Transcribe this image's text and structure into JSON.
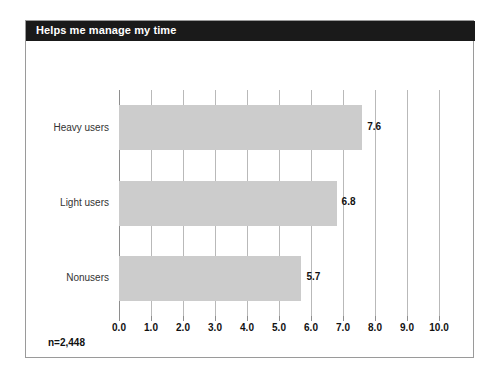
{
  "card": {
    "title": "Helps me manage my time",
    "footnote": "n=2,448"
  },
  "colors": {
    "title_bar": "#1a1a1a",
    "title_text": "#ffffff",
    "bar_fill": "#cccccc",
    "gridline": "#b9b9b9",
    "axis": "#8e8e8e",
    "frame": "#9a9a9a",
    "label_text": "#333333",
    "value_text": "#111111"
  },
  "chart_data": {
    "type": "bar",
    "orientation": "horizontal",
    "title": "Helps me manage my time",
    "xlabel": "",
    "ylabel": "",
    "categories": [
      "Heavy users",
      "Light users",
      "Nonusers"
    ],
    "values": [
      7.6,
      6.8,
      5.7
    ],
    "value_labels": [
      "7.6",
      "6.8",
      "5.7"
    ],
    "xlim": [
      0.0,
      10.0
    ],
    "xticks": [
      0.0,
      1.0,
      2.0,
      3.0,
      4.0,
      5.0,
      6.0,
      7.0,
      8.0,
      9.0,
      10.0
    ],
    "xtick_labels": [
      "0.0",
      "1.0",
      "2.0",
      "3.0",
      "4.0",
      "5.0",
      "6.0",
      "7.0",
      "8.0",
      "9.0",
      "10.0"
    ],
    "grid": true,
    "grid_axis": "x",
    "legend": false,
    "annotation": "n=2,448"
  }
}
